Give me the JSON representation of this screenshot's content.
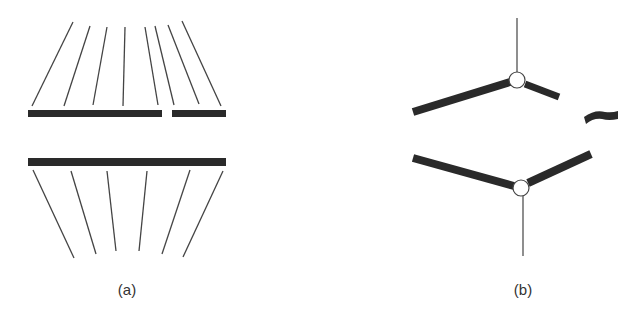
{
  "figure": {
    "panels": [
      {
        "id": "a",
        "label": "(a)",
        "upper_bars": [
          {
            "x1": 28,
            "x2": 162,
            "y": 113.5
          },
          {
            "x1": 172,
            "x2": 226,
            "y": 113.5
          }
        ],
        "upper_lines": [
          [
            73,
            22,
            32,
            106
          ],
          [
            90,
            26,
            64,
            106
          ],
          [
            107,
            27,
            93,
            105
          ],
          [
            125,
            27,
            123,
            106
          ],
          [
            145,
            27,
            158,
            105
          ],
          [
            155,
            26,
            174,
            105
          ],
          [
            168,
            25,
            199,
            104
          ],
          [
            182,
            21,
            221,
            106
          ]
        ],
        "lower_bar": {
          "x1": 28,
          "x2": 226,
          "y": 162
        },
        "lower_lines": [
          [
            33,
            170,
            74,
            258
          ],
          [
            71,
            171,
            96,
            254
          ],
          [
            107,
            171,
            116,
            251
          ],
          [
            147,
            171,
            139,
            251
          ],
          [
            190,
            170,
            162,
            254
          ],
          [
            223,
            171,
            183,
            257
          ]
        ]
      },
      {
        "id": "b",
        "label": "(b)"
      }
    ],
    "colors": {
      "bar": "#2a2a2a",
      "line": "#444444",
      "background": "#ffffff"
    }
  }
}
